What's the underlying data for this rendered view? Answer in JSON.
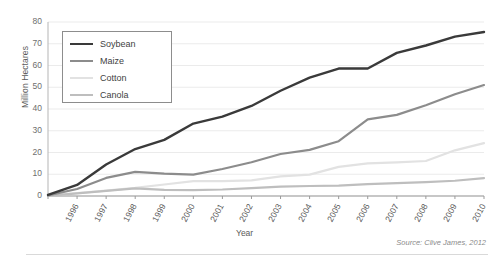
{
  "chart_data": {
    "type": "line",
    "title": "",
    "xlabel": "Year",
    "ylabel": "Million Hectares",
    "x": [
      1996,
      1997,
      1998,
      1999,
      2000,
      2001,
      2002,
      2003,
      2004,
      2005,
      2006,
      2007,
      2008,
      2009,
      2010,
      2011
    ],
    "categories": [
      "1996",
      "1997",
      "1998",
      "1999",
      "2000",
      "2001",
      "2002",
      "2003",
      "2004",
      "2005",
      "2006",
      "2007",
      "2008",
      "2009",
      "2010",
      "2011"
    ],
    "xlim": [
      1996,
      2011
    ],
    "ylim": [
      0,
      80
    ],
    "yticks": [
      0,
      10,
      20,
      30,
      40,
      50,
      60,
      70,
      80
    ],
    "grid": "horizontal",
    "legend_position": "top-left-inside",
    "series": [
      {
        "name": "Soybean",
        "color": "#3a3a3a",
        "width": 2.4,
        "values": [
          0.5,
          5.1,
          14.5,
          21.6,
          25.8,
          33.3,
          36.5,
          41.4,
          48.4,
          54.4,
          58.6,
          58.6,
          65.8,
          69.2,
          73.3,
          75.4
        ]
      },
      {
        "name": "Maize",
        "color": "#8c8c8c",
        "width": 2.2,
        "values": [
          0.3,
          3.2,
          8.3,
          11.1,
          10.3,
          9.8,
          12.4,
          15.5,
          19.3,
          21.2,
          25.2,
          35.2,
          37.3,
          41.7,
          46.8,
          51.0
        ]
      },
      {
        "name": "Cotton",
        "color": "#e2e2e2",
        "width": 2.2,
        "values": [
          0.2,
          1.3,
          2.5,
          3.7,
          5.3,
          6.8,
          6.8,
          7.2,
          9.0,
          9.8,
          13.4,
          15.0,
          15.5,
          16.1,
          21.0,
          24.3
        ]
      },
      {
        "name": "Canola",
        "color": "#bebebe",
        "width": 2.2,
        "values": [
          0.1,
          1.2,
          2.4,
          3.5,
          2.8,
          2.7,
          3.0,
          3.6,
          4.3,
          4.6,
          4.8,
          5.5,
          5.9,
          6.4,
          7.0,
          8.2
        ]
      }
    ],
    "source_note": "Source: Clive James, 2012"
  },
  "axis": {
    "y_label": "Million Hectares",
    "x_label": "Year",
    "y_ticks": [
      "80",
      "70",
      "60",
      "50",
      "40",
      "30",
      "20",
      "10",
      "0"
    ],
    "x_ticks": [
      "1996",
      "1997",
      "1998",
      "1999",
      "2000",
      "2001",
      "2002",
      "2003",
      "2004",
      "2005",
      "2006",
      "2007",
      "2008",
      "2009",
      "2010",
      "2011"
    ]
  },
  "legend": {
    "items": [
      {
        "label": "Soybean",
        "color": "#3a3a3a"
      },
      {
        "label": "Maize",
        "color": "#8c8c8c"
      },
      {
        "label": "Cotton",
        "color": "#e2e2e2"
      },
      {
        "label": "Canola",
        "color": "#bebebe"
      }
    ]
  },
  "footer": {
    "source": "Source: Clive James, 2012"
  },
  "colors": {
    "grid": "#ebebeb",
    "axis": "#9a9a9a",
    "text": "#5a5a5a",
    "legend_border": "#8d8d8d",
    "background": "#ffffff"
  }
}
